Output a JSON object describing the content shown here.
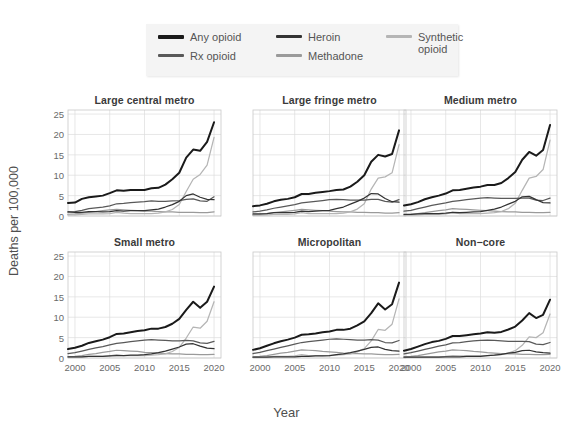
{
  "figure": {
    "xlabel": "Year",
    "ylabel": "Deaths per 100,000"
  },
  "legend": {
    "position": "top-center",
    "entries": [
      {
        "label": "Any opioid",
        "color": "#1a1a1a",
        "width": 2.6
      },
      {
        "label": "Rx opioid",
        "color": "#595959",
        "width": 1.8
      },
      {
        "label": "Heroin",
        "color": "#333333",
        "width": 1.8
      },
      {
        "label": "Methadone",
        "color": "#9a9a9a",
        "width": 1.8
      },
      {
        "label": "Synthetic opioid",
        "color": "#b5b5b5",
        "width": 1.8
      }
    ]
  },
  "axes": {
    "yticks": [
      0,
      5,
      10,
      15,
      20,
      25
    ],
    "xticks": [
      2000,
      2005,
      2010,
      2015,
      2020
    ],
    "ylim": [
      0,
      26
    ],
    "xlim": [
      1999,
      2021
    ],
    "grid": true
  },
  "chart_data": {
    "type": "line",
    "title": "",
    "xlabel": "Year",
    "ylabel": "Deaths per 100,000",
    "ylim": [
      0,
      26
    ],
    "xlim": [
      1999,
      2021
    ],
    "grid": true,
    "legend_position": "top-center",
    "x": [
      1999,
      2000,
      2001,
      2002,
      2003,
      2004,
      2005,
      2006,
      2007,
      2008,
      2009,
      2010,
      2011,
      2012,
      2013,
      2014,
      2015,
      2016,
      2017,
      2018,
      2019,
      2020
    ],
    "panels": [
      {
        "title": "Large central metro",
        "series": [
          {
            "name": "Any opioid",
            "color": "#1a1a1a",
            "values": [
              3.2,
              3.3,
              4.2,
              4.6,
              4.8,
              5.0,
              5.6,
              6.3,
              6.2,
              6.4,
              6.4,
              6.4,
              6.8,
              6.9,
              7.7,
              9.0,
              10.6,
              14.3,
              16.3,
              16.0,
              18.2,
              23.0
            ]
          },
          {
            "name": "Rx opioid",
            "color": "#595959",
            "values": [
              1.0,
              1.1,
              1.4,
              1.8,
              2.0,
              2.2,
              2.5,
              3.0,
              3.1,
              3.3,
              3.4,
              3.5,
              3.7,
              3.6,
              3.6,
              3.7,
              3.8,
              4.1,
              4.2,
              3.7,
              3.6,
              4.7
            ]
          },
          {
            "name": "Heroin",
            "color": "#333333",
            "values": [
              1.0,
              0.9,
              0.9,
              1.1,
              1.1,
              1.0,
              1.1,
              1.3,
              1.2,
              1.3,
              1.3,
              1.3,
              1.5,
              1.7,
              2.2,
              2.8,
              3.6,
              5.0,
              5.4,
              4.6,
              4.1,
              4.0
            ]
          },
          {
            "name": "Methadone",
            "color": "#9a9a9a",
            "values": [
              0.4,
              0.5,
              0.7,
              0.9,
              1.1,
              1.3,
              1.5,
              1.6,
              1.5,
              1.4,
              1.3,
              1.2,
              1.2,
              1.1,
              1.0,
              1.0,
              0.9,
              0.9,
              0.9,
              0.8,
              0.8,
              1.0
            ]
          },
          {
            "name": "Synthetic opioid",
            "color": "#b5b5b5",
            "values": [
              0.3,
              0.3,
              0.4,
              0.5,
              0.5,
              0.5,
              0.6,
              0.9,
              0.7,
              0.6,
              0.6,
              0.6,
              0.6,
              0.7,
              1.0,
              1.6,
              2.8,
              6.0,
              9.0,
              10.2,
              12.5,
              19.3
            ]
          }
        ]
      },
      {
        "title": "Large fringe metro",
        "series": [
          {
            "name": "Any opioid",
            "color": "#1a1a1a",
            "values": [
              2.4,
              2.6,
              3.0,
              3.6,
              4.0,
              4.2,
              4.6,
              5.4,
              5.4,
              5.7,
              5.9,
              6.1,
              6.4,
              6.5,
              7.2,
              8.4,
              10.0,
              13.3,
              15.0,
              14.6,
              15.2,
              21.0
            ]
          },
          {
            "name": "Rx opioid",
            "color": "#595959",
            "values": [
              1.0,
              1.2,
              1.5,
              1.9,
              2.2,
              2.5,
              2.8,
              3.2,
              3.4,
              3.6,
              3.8,
              4.0,
              4.1,
              4.0,
              3.9,
              3.9,
              3.9,
              4.1,
              4.1,
              3.6,
              3.4,
              4.0
            ]
          },
          {
            "name": "Heroin",
            "color": "#333333",
            "values": [
              0.5,
              0.5,
              0.6,
              0.8,
              0.8,
              0.8,
              0.9,
              1.2,
              1.1,
              1.2,
              1.3,
              1.4,
              1.8,
              2.2,
              2.9,
              3.6,
              4.4,
              5.5,
              5.4,
              4.3,
              3.5,
              3.4
            ]
          },
          {
            "name": "Methadone",
            "color": "#9a9a9a",
            "values": [
              0.3,
              0.4,
              0.6,
              0.8,
              1.0,
              1.2,
              1.4,
              1.6,
              1.5,
              1.4,
              1.3,
              1.2,
              1.1,
              1.0,
              1.0,
              0.9,
              0.9,
              0.8,
              0.8,
              0.7,
              0.7,
              0.8
            ]
          },
          {
            "name": "Synthetic opioid",
            "color": "#b5b5b5",
            "values": [
              0.2,
              0.2,
              0.3,
              0.4,
              0.4,
              0.4,
              0.5,
              0.8,
              0.6,
              0.6,
              0.6,
              0.6,
              0.6,
              0.7,
              1.0,
              1.7,
              3.0,
              6.6,
              9.3,
              9.6,
              10.6,
              17.5
            ]
          }
        ]
      },
      {
        "title": "Medium metro",
        "series": [
          {
            "name": "Any opioid",
            "color": "#1a1a1a",
            "values": [
              2.6,
              2.9,
              3.4,
              4.1,
              4.6,
              5.0,
              5.5,
              6.3,
              6.4,
              6.7,
              7.0,
              7.2,
              7.6,
              7.6,
              8.1,
              9.3,
              10.8,
              13.8,
              15.7,
              14.8,
              16.2,
              22.3
            ]
          },
          {
            "name": "Rx opioid",
            "color": "#595959",
            "values": [
              1.2,
              1.4,
              1.8,
              2.2,
              2.6,
              2.9,
              3.2,
              3.6,
              3.8,
              4.0,
              4.2,
              4.4,
              4.5,
              4.4,
              4.3,
              4.3,
              4.3,
              4.4,
              4.4,
              3.9,
              3.8,
              4.4
            ]
          },
          {
            "name": "Heroin",
            "color": "#333333",
            "values": [
              0.4,
              0.4,
              0.5,
              0.6,
              0.6,
              0.6,
              0.7,
              0.9,
              0.8,
              0.9,
              1.0,
              1.1,
              1.4,
              1.7,
              2.2,
              2.9,
              3.6,
              4.7,
              4.8,
              4.0,
              3.3,
              3.2
            ]
          },
          {
            "name": "Methadone",
            "color": "#9a9a9a",
            "values": [
              0.3,
              0.4,
              0.6,
              0.8,
              1.1,
              1.3,
              1.5,
              1.8,
              1.7,
              1.6,
              1.5,
              1.4,
              1.3,
              1.2,
              1.1,
              1.0,
              1.0,
              0.9,
              0.9,
              0.8,
              0.8,
              0.9
            ]
          },
          {
            "name": "Synthetic opioid",
            "color": "#b5b5b5",
            "values": [
              0.2,
              0.2,
              0.3,
              0.4,
              0.4,
              0.4,
              0.5,
              0.9,
              0.6,
              0.6,
              0.6,
              0.6,
              0.7,
              0.8,
              1.1,
              1.8,
              3.1,
              6.3,
              9.3,
              9.7,
              11.4,
              18.6
            ]
          }
        ]
      },
      {
        "title": "Small metro",
        "series": [
          {
            "name": "Any opioid",
            "color": "#1a1a1a",
            "values": [
              2.2,
              2.5,
              3.0,
              3.7,
              4.1,
              4.5,
              5.1,
              5.9,
              6.0,
              6.3,
              6.6,
              6.8,
              7.2,
              7.2,
              7.6,
              8.4,
              9.6,
              11.8,
              13.8,
              12.3,
              13.8,
              17.5
            ]
          },
          {
            "name": "Rx opioid",
            "color": "#595959",
            "values": [
              1.1,
              1.3,
              1.7,
              2.1,
              2.5,
              2.8,
              3.2,
              3.6,
              3.8,
              4.0,
              4.2,
              4.4,
              4.5,
              4.4,
              4.3,
              4.2,
              4.2,
              4.3,
              4.2,
              3.7,
              3.6,
              4.1
            ]
          },
          {
            "name": "Heroin",
            "color": "#333333",
            "values": [
              0.3,
              0.3,
              0.3,
              0.4,
              0.4,
              0.4,
              0.5,
              0.6,
              0.6,
              0.7,
              0.7,
              0.8,
              1.0,
              1.3,
              1.7,
              2.2,
              2.7,
              3.4,
              3.5,
              2.9,
              2.4,
              2.3
            ]
          },
          {
            "name": "Methadone",
            "color": "#9a9a9a",
            "values": [
              0.3,
              0.4,
              0.6,
              0.9,
              1.1,
              1.4,
              1.6,
              1.9,
              1.8,
              1.7,
              1.6,
              1.4,
              1.3,
              1.2,
              1.1,
              1.0,
              1.0,
              0.9,
              0.9,
              0.8,
              0.8,
              0.9
            ]
          },
          {
            "name": "Synthetic opioid",
            "color": "#b5b5b5",
            "values": [
              0.2,
              0.2,
              0.3,
              0.4,
              0.4,
              0.4,
              0.5,
              0.8,
              0.6,
              0.6,
              0.6,
              0.6,
              0.7,
              0.8,
              1.0,
              1.6,
              2.6,
              4.9,
              7.6,
              7.3,
              9.0,
              13.8
            ]
          }
        ]
      },
      {
        "title": "Micropolitan",
        "series": [
          {
            "name": "Any opioid",
            "color": "#1a1a1a",
            "values": [
              2.0,
              2.4,
              3.0,
              3.6,
              4.1,
              4.5,
              5.0,
              5.7,
              5.8,
              6.0,
              6.3,
              6.5,
              6.9,
              6.9,
              7.2,
              8.0,
              9.0,
              11.0,
              13.4,
              11.9,
              13.2,
              18.5
            ]
          },
          {
            "name": "Rx opioid",
            "color": "#595959",
            "values": [
              1.1,
              1.4,
              1.8,
              2.2,
              2.6,
              3.0,
              3.4,
              3.8,
              4.0,
              4.2,
              4.4,
              4.6,
              4.7,
              4.6,
              4.5,
              4.4,
              4.4,
              4.5,
              4.4,
              3.8,
              3.7,
              4.3
            ]
          },
          {
            "name": "Heroin",
            "color": "#333333",
            "values": [
              0.2,
              0.2,
              0.2,
              0.3,
              0.3,
              0.3,
              0.3,
              0.4,
              0.4,
              0.5,
              0.5,
              0.6,
              0.8,
              1.0,
              1.3,
              1.7,
              2.1,
              2.6,
              2.7,
              2.1,
              1.8,
              1.7
            ]
          },
          {
            "name": "Methadone",
            "color": "#9a9a9a",
            "values": [
              0.3,
              0.4,
              0.6,
              0.9,
              1.2,
              1.4,
              1.7,
              2.0,
              1.9,
              1.8,
              1.6,
              1.5,
              1.4,
              1.2,
              1.1,
              1.1,
              1.0,
              1.0,
              0.9,
              0.8,
              0.8,
              0.9
            ]
          },
          {
            "name": "Synthetic opioid",
            "color": "#b5b5b5",
            "values": [
              0.2,
              0.2,
              0.3,
              0.4,
              0.4,
              0.4,
              0.5,
              0.8,
              0.6,
              0.6,
              0.6,
              0.6,
              0.7,
              0.8,
              1.0,
              1.5,
              2.3,
              4.2,
              7.0,
              6.8,
              8.3,
              14.5
            ]
          }
        ]
      },
      {
        "title": "Non−core",
        "series": [
          {
            "name": "Any opioid",
            "color": "#1a1a1a",
            "values": [
              1.8,
              2.2,
              2.8,
              3.4,
              3.9,
              4.2,
              4.7,
              5.4,
              5.4,
              5.6,
              5.8,
              6.0,
              6.3,
              6.2,
              6.4,
              7.0,
              7.7,
              9.2,
              11.0,
              9.8,
              10.6,
              14.3
            ]
          },
          {
            "name": "Rx opioid",
            "color": "#595959",
            "values": [
              1.0,
              1.3,
              1.7,
              2.1,
              2.5,
              2.9,
              3.2,
              3.7,
              3.8,
              4.0,
              4.2,
              4.3,
              4.4,
              4.3,
              4.2,
              4.1,
              4.1,
              4.1,
              4.0,
              3.4,
              3.3,
              3.8
            ]
          },
          {
            "name": "Heroin",
            "color": "#333333",
            "values": [
              0.2,
              0.2,
              0.2,
              0.2,
              0.2,
              0.2,
              0.3,
              0.3,
              0.3,
              0.4,
              0.4,
              0.4,
              0.6,
              0.7,
              0.9,
              1.2,
              1.4,
              1.8,
              1.9,
              1.5,
              1.3,
              1.2
            ]
          },
          {
            "name": "Methadone",
            "color": "#9a9a9a",
            "values": [
              0.3,
              0.4,
              0.6,
              0.9,
              1.2,
              1.5,
              1.7,
              2.0,
              1.9,
              1.8,
              1.6,
              1.5,
              1.3,
              1.2,
              1.1,
              1.0,
              1.0,
              0.9,
              0.9,
              0.8,
              0.8,
              0.9
            ]
          },
          {
            "name": "Synthetic opioid",
            "color": "#b5b5b5",
            "values": [
              0.2,
              0.2,
              0.2,
              0.3,
              0.3,
              0.3,
              0.4,
              0.6,
              0.5,
              0.5,
              0.5,
              0.5,
              0.6,
              0.7,
              0.8,
              1.2,
              1.8,
              3.1,
              5.2,
              5.0,
              6.2,
              10.8
            ]
          }
        ]
      }
    ]
  }
}
